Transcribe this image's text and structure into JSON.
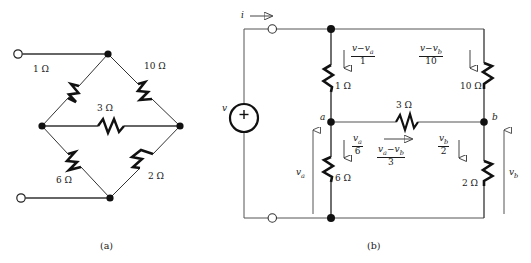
{
  "figure": {
    "type": "circuit-diagram",
    "panels": [
      {
        "id": "a",
        "caption": "(a)",
        "description": "Bridge network of five resistors with two open terminals",
        "resistors": [
          {
            "name": "R1",
            "label": "1 Ω",
            "value": 1,
            "unit": "ohm",
            "branch": "top-left"
          },
          {
            "name": "R10",
            "label": "10 Ω",
            "value": 10,
            "unit": "ohm",
            "branch": "top-right"
          },
          {
            "name": "R3",
            "label": "3 Ω",
            "value": 3,
            "unit": "ohm",
            "branch": "middle-bridge"
          },
          {
            "name": "R6",
            "label": "6 Ω",
            "value": 6,
            "unit": "ohm",
            "branch": "bottom-left"
          },
          {
            "name": "R2",
            "label": "2 Ω",
            "value": 2,
            "unit": "ohm",
            "branch": "bottom-right"
          }
        ],
        "terminals": [
          "top-open-terminal",
          "bottom-open-terminal"
        ]
      },
      {
        "id": "b",
        "caption": "(b)",
        "description": "Redrawn bridge with voltage source v, node voltages v_a and v_b, and branch currents",
        "source": {
          "name": "voltage-source",
          "label": "v",
          "polarity": "+"
        },
        "current_in": "i",
        "nodes": [
          {
            "name": "node-a",
            "label": "a"
          },
          {
            "name": "node-b",
            "label": "b"
          }
        ],
        "resistors": [
          {
            "name": "R1",
            "label": "1 Ω",
            "value": 1
          },
          {
            "name": "R10",
            "label": "10 Ω",
            "value": 10
          },
          {
            "name": "R3",
            "label": "3 Ω",
            "value": 3
          },
          {
            "name": "R6",
            "label": "6 Ω",
            "value": 6
          },
          {
            "name": "R2",
            "label": "2 Ω",
            "value": 2
          }
        ],
        "branch_currents": [
          {
            "name": "current-r1",
            "numerator": "v − v",
            "numerator_sub": "a",
            "denominator": "1",
            "direction": "down"
          },
          {
            "name": "current-r10",
            "numerator": "v − v",
            "numerator_sub": "b",
            "denominator": "10",
            "direction": "down"
          },
          {
            "name": "current-r6",
            "numerator": "v",
            "numerator_sub": "a",
            "denominator": "6",
            "direction": "down"
          },
          {
            "name": "current-r3",
            "numerator": "v",
            "numerator_sub": "a − v b",
            "denominator": "3",
            "direction": "right"
          },
          {
            "name": "current-r2",
            "numerator": "v",
            "numerator_sub": "b",
            "denominator": "2",
            "direction": "down"
          }
        ],
        "voltage_labels": [
          {
            "name": "voltage-va",
            "label": "v",
            "sub": "a",
            "direction": "up"
          },
          {
            "name": "voltage-vb",
            "label": "v",
            "sub": "b",
            "direction": "up"
          }
        ]
      }
    ]
  },
  "panel_a": {
    "caption": "(a)",
    "r1": "1 Ω",
    "r10": "10 Ω",
    "r3": "3 Ω",
    "r6": "6 Ω",
    "r2": "2 Ω"
  },
  "panel_b": {
    "caption": "(b)",
    "r1": "1 Ω",
    "r10": "10 Ω",
    "r3": "3 Ω",
    "r6": "6 Ω",
    "r2": "2 Ω",
    "source_label": "v",
    "source_polarity": "+",
    "current_label": "i",
    "node_a": "a",
    "node_b": "b",
    "va_label": "v",
    "va_sub": "a",
    "vb_label": "v",
    "vb_sub": "b",
    "f1_num_v": "v",
    "f1_num_minus": "−",
    "f1_num_va": "v",
    "f1_num_va_sub": "a",
    "f1_den": "1",
    "f10_num_v": "v",
    "f10_num_minus": "−",
    "f10_num_vb": "v",
    "f10_num_vb_sub": "b",
    "f10_den": "10",
    "f6_num": "v",
    "f6_num_sub": "a",
    "f6_den": "6",
    "f3_num_va": "v",
    "f3_num_va_sub": "a",
    "f3_num_minus": "−",
    "f3_num_vb": "v",
    "f3_num_vb_sub": "b",
    "f3_den": "3",
    "f2_num": "v",
    "f2_num_sub": "b",
    "f2_den": "2"
  }
}
